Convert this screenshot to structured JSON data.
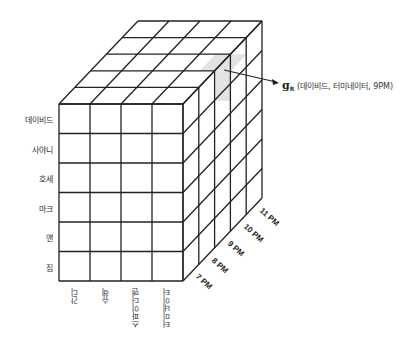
{
  "diagram": {
    "type": "data-cube",
    "rows": [
      "데이비드",
      "사야니",
      "호세",
      "마크",
      "앤",
      "짐"
    ],
    "columns": [
      "간디",
      "슈렉",
      "스파이더맨",
      "터미네이터"
    ],
    "depth": [
      "7 PM",
      "8 PM",
      "9 PM",
      "10 PM",
      "11 PM"
    ],
    "highlight": {
      "symbol": "g",
      "subscript": "R",
      "label": "(데이비드, 터미네이터, 9PM)",
      "color": "#e3e3e3"
    },
    "line_color": "#222222"
  }
}
